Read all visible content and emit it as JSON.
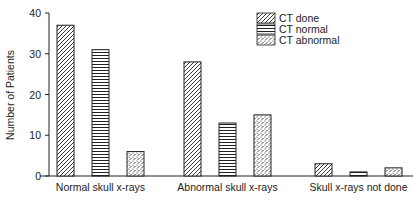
{
  "chart_data": {
    "type": "bar",
    "title": "",
    "xlabel": "",
    "ylabel": "Number of Patients",
    "ylim": [
      0,
      40
    ],
    "yticks": [
      0,
      10,
      20,
      30,
      40
    ],
    "grid": false,
    "legend_position": "upper right",
    "categories": [
      "Normal skull x-rays",
      "Abnormal skull x-rays",
      "Skull x-rays not done"
    ],
    "series": [
      {
        "name": "CT done",
        "pattern": "diagonal-hatch",
        "values": [
          37,
          28,
          3
        ]
      },
      {
        "name": "CT normal",
        "pattern": "horizontal-lines",
        "values": [
          31,
          13,
          1
        ]
      },
      {
        "name": "CT abnormal",
        "pattern": "stipple-dots",
        "values": [
          6,
          15,
          2
        ]
      }
    ]
  },
  "colors": {
    "ink": "#222222",
    "background": "#ffffff"
  }
}
